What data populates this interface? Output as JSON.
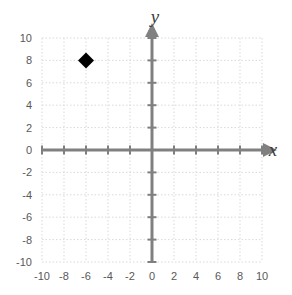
{
  "chart_data": {
    "type": "scatter",
    "title": "",
    "xlabel": "x",
    "ylabel": "y",
    "xlim": [
      -10,
      10
    ],
    "ylim": [
      -10,
      10
    ],
    "xtick_step": 2,
    "ytick_step": 2,
    "grid": true,
    "grid_style": "dotted",
    "legend": "none",
    "xticks": [
      "-10",
      "-8",
      "-6",
      "-4",
      "-2",
      "0",
      "2",
      "4",
      "6",
      "8",
      "10"
    ],
    "yticks": [
      "10",
      "8",
      "6",
      "4",
      "2",
      "0",
      "-2",
      "-4",
      "-6",
      "-8",
      "-10"
    ],
    "xtick_values": [
      -10,
      -8,
      -6,
      -4,
      -2,
      0,
      2,
      4,
      6,
      8,
      10
    ],
    "ytick_values": [
      10,
      8,
      6,
      4,
      2,
      0,
      -2,
      -4,
      -6,
      -8,
      -10
    ],
    "series": [
      {
        "name": "plotted-point",
        "marker": "diamond",
        "color": "#000000",
        "size": 16,
        "points": [
          {
            "x": -6,
            "y": 8,
            "label": "(-6, 8)"
          }
        ]
      }
    ]
  },
  "axes": {
    "x_axis_label": "x",
    "y_axis_label": "y",
    "axis_color": "#808080",
    "grid_color": "#d9d9d9",
    "arrow_x": "right",
    "arrow_y": "up"
  },
  "colors": {
    "background": "#ffffff",
    "axis": "#808080",
    "grid": "#d9d9d9",
    "tick_text": "#595959",
    "marker": "#000000",
    "axis_title": "#3d3d3d"
  }
}
